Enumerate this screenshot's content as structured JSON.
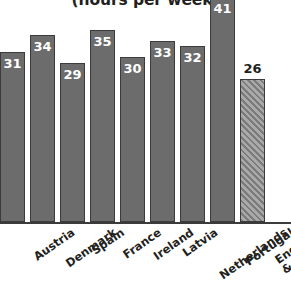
{
  "chart_data": {
    "type": "bar",
    "title": "(hours per week)",
    "xlabel": "",
    "ylabel": "",
    "ylim": [
      0,
      44
    ],
    "grid": false,
    "legend": "none",
    "note": "Title is clipped at the top edge of the screenshot; the tallest bar (Portugal, 41) is also clipped at the top.",
    "categories": [
      "Austria",
      "Denmark",
      "Spain",
      "France",
      "Ireland",
      "Latvia",
      "Netherlands",
      "Portugal",
      "England\n& Wales"
    ],
    "values": [
      31,
      34,
      29,
      35,
      30,
      33,
      32,
      41,
      26
    ],
    "value_labels": [
      "31",
      "34",
      "29",
      "35",
      "30",
      "33",
      "32",
      "41",
      "26"
    ],
    "bars": [
      {
        "category": "Austria",
        "value": 31,
        "label": "31",
        "style": "solid",
        "label_position": "inside",
        "label_color": "#ffffff"
      },
      {
        "category": "Denmark",
        "value": 34,
        "label": "34",
        "style": "solid",
        "label_position": "inside",
        "label_color": "#ffffff"
      },
      {
        "category": "Spain",
        "value": 29,
        "label": "29",
        "style": "solid",
        "label_position": "inside",
        "label_color": "#ffffff"
      },
      {
        "category": "France",
        "value": 35,
        "label": "35",
        "style": "solid",
        "label_position": "inside",
        "label_color": "#ffffff"
      },
      {
        "category": "Ireland",
        "value": 30,
        "label": "30",
        "style": "solid",
        "label_position": "inside",
        "label_color": "#ffffff"
      },
      {
        "category": "Latvia",
        "value": 33,
        "label": "33",
        "style": "solid",
        "label_position": "inside",
        "label_color": "#ffffff"
      },
      {
        "category": "Netherlands",
        "value": 32,
        "label": "32",
        "style": "solid",
        "label_position": "inside",
        "label_color": "#ffffff"
      },
      {
        "category": "Portugal",
        "value": 41,
        "label": "41",
        "style": "solid",
        "label_position": "inside",
        "label_color": "#ffffff"
      },
      {
        "category": "England & Wales",
        "value": 26,
        "label": "26",
        "style": "hatched",
        "label_position": "outside",
        "label_color": "#231f20"
      }
    ],
    "colors": {
      "bar_fill": "#6c6c6c",
      "bar_border": "#3b3b3b",
      "hatch_fill": "#8e8e8e",
      "hatch_line": "#7b7b7b",
      "axis": "#3b3b3b",
      "text": "#231f20",
      "value_text_inside": "#ffffff",
      "background": "#ffffff"
    }
  }
}
